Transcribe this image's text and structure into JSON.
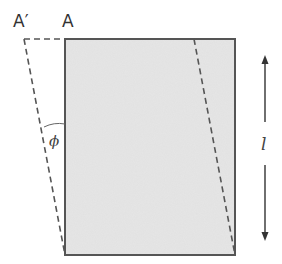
{
  "diagram": {
    "labels": {
      "point_original": "A",
      "point_displaced": "A′",
      "angle": "ϕ",
      "length": "l"
    },
    "colors": {
      "block_fill": "#e6e6e6",
      "block_stroke": "#555555",
      "dash_stroke": "#555555",
      "arrow": "#333333"
    },
    "geometry": {
      "block": {
        "x": 65,
        "y": 39,
        "width": 170,
        "height": 216
      },
      "displaced_corner": {
        "x": 24,
        "y": 39
      },
      "shear_line_top": {
        "x": 194,
        "y": 39
      },
      "length_arrow": {
        "x": 265,
        "y_top": 55,
        "y_bottom": 241
      }
    }
  }
}
